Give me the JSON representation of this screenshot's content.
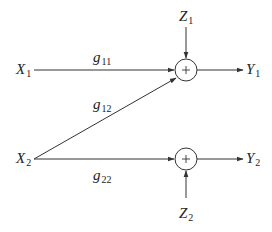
{
  "diagram": {
    "type": "signal-flow / interference channel",
    "inputs": [
      {
        "id": "X1",
        "base": "X",
        "sub": "1"
      },
      {
        "id": "X2",
        "base": "X",
        "sub": "2"
      }
    ],
    "outputs": [
      {
        "id": "Y1",
        "base": "Y",
        "sub": "1"
      },
      {
        "id": "Y2",
        "base": "Y",
        "sub": "2"
      }
    ],
    "noises": [
      {
        "id": "Z1",
        "base": "Z",
        "sub": "1"
      },
      {
        "id": "Z2",
        "base": "Z",
        "sub": "2"
      }
    ],
    "gains": [
      {
        "id": "g11",
        "base": "g",
        "sub": "11",
        "from": "X1",
        "to": "sum1"
      },
      {
        "id": "g12",
        "base": "g",
        "sub": "12",
        "from": "X2",
        "to": "sum1"
      },
      {
        "id": "g22",
        "base": "g",
        "sub": "22",
        "from": "X2",
        "to": "sum2"
      }
    ],
    "summers": [
      {
        "id": "sum1",
        "symbol": "+",
        "inputs": [
          "g11",
          "g12",
          "Z1"
        ],
        "output": "Y1"
      },
      {
        "id": "sum2",
        "symbol": "+",
        "inputs": [
          "g22",
          "Z2"
        ],
        "output": "Y2"
      }
    ],
    "colors": {
      "stroke": "#333333",
      "text": "#222222",
      "background": "#ffffff"
    }
  }
}
